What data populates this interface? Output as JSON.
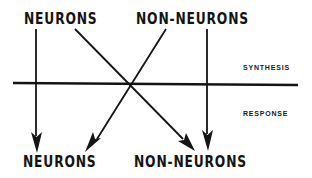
{
  "diagram": {
    "type": "flow-crossing",
    "top_nodes": [
      {
        "id": "top-neurons",
        "label": "NEURONS"
      },
      {
        "id": "top-non-neurons",
        "label": "NON-NEURONS"
      }
    ],
    "bottom_nodes": [
      {
        "id": "bottom-neurons",
        "label": "NEURONS"
      },
      {
        "id": "bottom-non-neurons",
        "label": "NON-NEURONS"
      }
    ],
    "phases": {
      "upper": "SYNTHESIS",
      "lower": "RESPONSE"
    },
    "edges": [
      {
        "from": "top-neurons",
        "to": "bottom-neurons"
      },
      {
        "from": "top-neurons",
        "to": "bottom-non-neurons"
      },
      {
        "from": "top-non-neurons",
        "to": "bottom-neurons"
      },
      {
        "from": "top-non-neurons",
        "to": "bottom-non-neurons"
      }
    ],
    "colors": {
      "ink": "#141414",
      "background": "#ffffff"
    }
  }
}
